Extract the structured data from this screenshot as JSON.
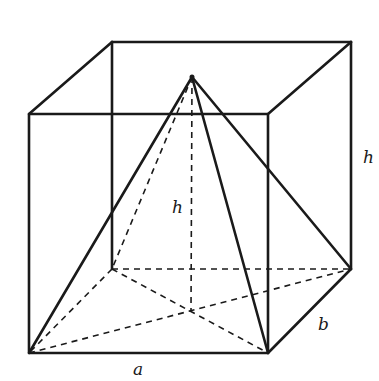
{
  "diagram": {
    "labels": {
      "a": "a",
      "b": "b",
      "h_edge": "h",
      "h_height": "h"
    },
    "colors": {
      "line": "#1a1a1a",
      "background": "#ffffff"
    }
  }
}
